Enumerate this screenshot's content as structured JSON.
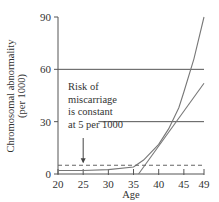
{
  "chart_data": {
    "type": "line",
    "title": "",
    "xlabel": "Age",
    "ylabel": "Chromosomal abnormality (per 1000)",
    "ylabel_lines": [
      "Chromosomal abnormality",
      "(per 1000)"
    ],
    "x_ticks": [
      20,
      25,
      30,
      35,
      40,
      45,
      49
    ],
    "y_ticks": [
      0,
      30,
      60,
      90
    ],
    "xlim": [
      20,
      49
    ],
    "ylim": [
      0,
      90
    ],
    "grid": false,
    "series": [
      {
        "name": "Chromosomal abnormality (curve)",
        "style": "solid-curve",
        "x": [
          20,
          25,
          30,
          35,
          37,
          40,
          42,
          44,
          45,
          47,
          49
        ],
        "y": [
          2,
          2,
          2.5,
          4,
          8,
          17,
          26,
          38,
          47,
          66,
          90
        ]
      },
      {
        "name": "Tangent line",
        "style": "solid-line",
        "x": [
          36,
          49
        ],
        "y": [
          0,
          52
        ]
      },
      {
        "name": "Risk of miscarriage",
        "style": "dashed",
        "x": [
          20,
          49
        ],
        "y": [
          5,
          5
        ]
      }
    ],
    "reference_lines": [
      {
        "y": 60,
        "x_from": 20,
        "x_to": 49
      },
      {
        "y": 30,
        "x_from": 28,
        "x_to": 49
      }
    ],
    "annotations": [
      {
        "text_lines": [
          "Risk of",
          "miscarriage",
          "is constant",
          "at 5 per 1000"
        ],
        "arrow_to": {
          "x": 25,
          "y": 5
        }
      }
    ]
  }
}
